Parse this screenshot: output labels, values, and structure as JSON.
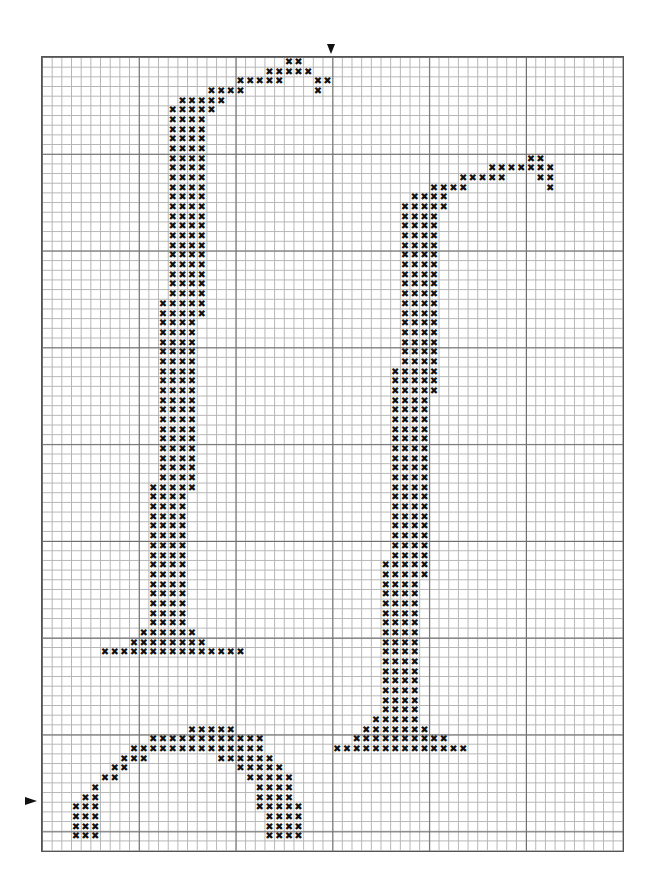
{
  "pattern": {
    "type": "cross-stitch chart",
    "cols": 60,
    "rows": 82,
    "cell_px": 9.68,
    "stitch_symbol": "✖",
    "colors": {
      "background": "#ffffff",
      "minor_grid": "#b5b5b5",
      "major_grid": "#6e6e6e",
      "stitch": "#111111",
      "marker": "#111111"
    },
    "center_markers": {
      "top_col": 30,
      "left_row": 77
    },
    "runs": [
      [
        0,
        25,
        26
      ],
      [
        1,
        23,
        27
      ],
      [
        2,
        20,
        24
      ],
      [
        2,
        28,
        29
      ],
      [
        3,
        17,
        20
      ],
      [
        3,
        28,
        28
      ],
      [
        4,
        14,
        18
      ],
      [
        5,
        13,
        17
      ],
      [
        6,
        13,
        16
      ],
      [
        7,
        13,
        16
      ],
      [
        8,
        13,
        16
      ],
      [
        9,
        13,
        16
      ],
      [
        10,
        13,
        16
      ],
      [
        10,
        50,
        51
      ],
      [
        11,
        13,
        16
      ],
      [
        11,
        46,
        52
      ],
      [
        12,
        13,
        16
      ],
      [
        12,
        43,
        47
      ],
      [
        12,
        51,
        52
      ],
      [
        13,
        13,
        16
      ],
      [
        13,
        40,
        43
      ],
      [
        13,
        52,
        52
      ],
      [
        14,
        13,
        16
      ],
      [
        14,
        38,
        41
      ],
      [
        15,
        13,
        16
      ],
      [
        15,
        37,
        41
      ],
      [
        16,
        13,
        16
      ],
      [
        16,
        37,
        40
      ],
      [
        17,
        13,
        16
      ],
      [
        17,
        37,
        40
      ],
      [
        18,
        13,
        16
      ],
      [
        18,
        37,
        40
      ],
      [
        19,
        13,
        16
      ],
      [
        19,
        37,
        40
      ],
      [
        20,
        13,
        16
      ],
      [
        20,
        37,
        40
      ],
      [
        21,
        13,
        16
      ],
      [
        21,
        37,
        40
      ],
      [
        22,
        13,
        16
      ],
      [
        22,
        37,
        40
      ],
      [
        23,
        13,
        16
      ],
      [
        23,
        37,
        40
      ],
      [
        24,
        13,
        16
      ],
      [
        24,
        37,
        40
      ],
      [
        25,
        12,
        16
      ],
      [
        25,
        37,
        40
      ],
      [
        26,
        12,
        16
      ],
      [
        26,
        37,
        40
      ],
      [
        27,
        12,
        15
      ],
      [
        27,
        37,
        40
      ],
      [
        28,
        12,
        15
      ],
      [
        28,
        37,
        40
      ],
      [
        29,
        12,
        15
      ],
      [
        29,
        37,
        40
      ],
      [
        30,
        12,
        15
      ],
      [
        30,
        37,
        40
      ],
      [
        31,
        12,
        15
      ],
      [
        31,
        37,
        40
      ],
      [
        32,
        12,
        15
      ],
      [
        32,
        36,
        40
      ],
      [
        33,
        12,
        15
      ],
      [
        33,
        36,
        40
      ],
      [
        34,
        12,
        15
      ],
      [
        34,
        36,
        40
      ],
      [
        35,
        12,
        15
      ],
      [
        35,
        36,
        39
      ],
      [
        36,
        12,
        15
      ],
      [
        36,
        36,
        39
      ],
      [
        37,
        12,
        15
      ],
      [
        37,
        36,
        39
      ],
      [
        38,
        12,
        15
      ],
      [
        38,
        36,
        39
      ],
      [
        39,
        12,
        15
      ],
      [
        39,
        36,
        39
      ],
      [
        40,
        12,
        15
      ],
      [
        40,
        36,
        39
      ],
      [
        41,
        12,
        15
      ],
      [
        41,
        36,
        39
      ],
      [
        42,
        12,
        15
      ],
      [
        42,
        36,
        39
      ],
      [
        43,
        12,
        15
      ],
      [
        43,
        36,
        39
      ],
      [
        44,
        11,
        15
      ],
      [
        44,
        36,
        39
      ],
      [
        45,
        11,
        14
      ],
      [
        45,
        36,
        39
      ],
      [
        46,
        11,
        14
      ],
      [
        46,
        36,
        39
      ],
      [
        47,
        11,
        14
      ],
      [
        47,
        36,
        39
      ],
      [
        48,
        11,
        14
      ],
      [
        48,
        36,
        39
      ],
      [
        49,
        11,
        14
      ],
      [
        49,
        36,
        39
      ],
      [
        50,
        11,
        14
      ],
      [
        50,
        36,
        39
      ],
      [
        51,
        11,
        14
      ],
      [
        51,
        36,
        39
      ],
      [
        52,
        11,
        14
      ],
      [
        52,
        35,
        39
      ],
      [
        53,
        11,
        14
      ],
      [
        53,
        35,
        39
      ],
      [
        54,
        11,
        14
      ],
      [
        54,
        35,
        38
      ],
      [
        55,
        11,
        14
      ],
      [
        55,
        35,
        38
      ],
      [
        56,
        11,
        14
      ],
      [
        56,
        35,
        38
      ],
      [
        57,
        11,
        14
      ],
      [
        57,
        35,
        38
      ],
      [
        58,
        11,
        14
      ],
      [
        58,
        35,
        38
      ],
      [
        59,
        10,
        15
      ],
      [
        59,
        35,
        38
      ],
      [
        60,
        9,
        16
      ],
      [
        60,
        35,
        38
      ],
      [
        61,
        6,
        20
      ],
      [
        61,
        35,
        38
      ],
      [
        62,
        35,
        38
      ],
      [
        63,
        35,
        38
      ],
      [
        64,
        35,
        38
      ],
      [
        65,
        35,
        38
      ],
      [
        66,
        35,
        38
      ],
      [
        67,
        35,
        38
      ],
      [
        68,
        34,
        38
      ],
      [
        69,
        33,
        39
      ],
      [
        69,
        15,
        19
      ],
      [
        70,
        11,
        22
      ],
      [
        70,
        32,
        41
      ],
      [
        71,
        9,
        22
      ],
      [
        71,
        30,
        43
      ],
      [
        72,
        8,
        10
      ],
      [
        72,
        18,
        23
      ],
      [
        73,
        7,
        8
      ],
      [
        73,
        20,
        24
      ],
      [
        74,
        6,
        7
      ],
      [
        74,
        21,
        25
      ],
      [
        75,
        5,
        5
      ],
      [
        75,
        22,
        25
      ],
      [
        76,
        4,
        5
      ],
      [
        76,
        22,
        25
      ],
      [
        77,
        3,
        5
      ],
      [
        77,
        22,
        26
      ],
      [
        78,
        3,
        5
      ],
      [
        78,
        23,
        26
      ],
      [
        79,
        3,
        5
      ],
      [
        79,
        23,
        26
      ],
      [
        80,
        3,
        5
      ],
      [
        80,
        23,
        26
      ]
    ]
  }
}
